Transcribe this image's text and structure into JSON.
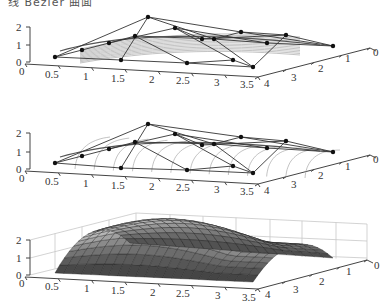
{
  "caption_fragment": "线 Bézier 曲面",
  "colors": {
    "axis": "#444444",
    "net": "#333333",
    "point": "#111111",
    "curve": "#9a9a9a",
    "grid": "#c8c8c8",
    "surface_dark": "#3a3a3a",
    "surface_light": "#c9c9c9",
    "surface_edge": "#1a1a1a"
  },
  "chart_data": [
    {
      "type": "surface-wireframe",
      "title": "",
      "description": "Bézier control net with isoparametric curves (u-direction)",
      "xlabel": "",
      "ylabel": "",
      "zlabel": "",
      "x_ticks": [
        "0",
        "0.5",
        "1",
        "1.5",
        "2",
        "2.5",
        "3",
        "3.5"
      ],
      "y_ticks": [
        "0",
        "1",
        "2",
        "3",
        "4"
      ],
      "z_ticks": [
        "0",
        "1",
        "2"
      ],
      "xlim": [
        0,
        3.5
      ],
      "ylim": [
        0,
        4
      ],
      "zlim": [
        0,
        2
      ],
      "grid": false,
      "control_points": [
        [
          0.5,
          4,
          0.5
        ],
        [
          1,
          3,
          1
        ],
        [
          1.5,
          2,
          1
        ],
        [
          2,
          1,
          2
        ],
        [
          2.5,
          0,
          1
        ],
        [
          1.5,
          4,
          0
        ],
        [
          2.5,
          3,
          1
        ],
        [
          3,
          2,
          1
        ],
        [
          3.5,
          1,
          1
        ],
        [
          3.5,
          0,
          0.5
        ],
        [
          2.5,
          4,
          0
        ],
        [
          3.5,
          4,
          0
        ]
      ]
    },
    {
      "type": "surface-wireframe",
      "title": "",
      "description": "Bézier control net with isoparametric curves (v-direction)",
      "xlabel": "",
      "ylabel": "",
      "zlabel": "",
      "x_ticks": [
        "0",
        "0.5",
        "1",
        "1.5",
        "2",
        "2.5",
        "3",
        "3.5"
      ],
      "y_ticks": [
        "0",
        "1",
        "2",
        "3",
        "4"
      ],
      "z_ticks": [
        "0",
        "1",
        "2"
      ],
      "xlim": [
        0,
        3.5
      ],
      "ylim": [
        0,
        4
      ],
      "zlim": [
        0,
        2
      ],
      "grid": false
    },
    {
      "type": "surface",
      "title": "",
      "description": "Shaded Bézier surface patch",
      "xlabel": "",
      "ylabel": "",
      "zlabel": "",
      "x_ticks": [
        "0",
        "0.5",
        "1",
        "1.5",
        "2",
        "2.5",
        "3",
        "3.5"
      ],
      "y_ticks": [
        "0",
        "1",
        "2",
        "3",
        "4"
      ],
      "z_ticks": [
        "0",
        "1",
        "2"
      ],
      "xlim": [
        0,
        3.5
      ],
      "ylim": [
        0,
        4
      ],
      "zlim": [
        0,
        2
      ],
      "grid": true
    }
  ],
  "plots": [
    {
      "id": "top",
      "x_axis": {
        "from": [
          25,
          64
        ],
        "to": [
          258,
          77
        ]
      },
      "y_axis": {
        "from": [
          258,
          77
        ],
        "to": [
          370,
          48
        ]
      },
      "z_axis": {
        "x": 30,
        "from": 62,
        "to": 27
      },
      "z_labels": [
        {
          "t": "0",
          "x": 16,
          "y": 66
        },
        {
          "t": "1",
          "x": 16,
          "y": 49
        },
        {
          "t": "2",
          "x": 16,
          "y": 31
        }
      ],
      "x_labels": [
        {
          "t": "0",
          "x": 19,
          "y": 75
        },
        {
          "t": "0.5",
          "x": 45,
          "y": 78
        },
        {
          "t": "1",
          "x": 83,
          "y": 80
        },
        {
          "t": "1.5",
          "x": 111,
          "y": 82
        },
        {
          "t": "2",
          "x": 149,
          "y": 83
        },
        {
          "t": "2.5",
          "x": 176,
          "y": 84
        },
        {
          "t": "3",
          "x": 214,
          "y": 86
        },
        {
          "t": "3.5",
          "x": 240,
          "y": 88
        }
      ],
      "y_labels": [
        {
          "t": "0",
          "x": 373,
          "y": 56
        },
        {
          "t": "1",
          "x": 345,
          "y": 62
        },
        {
          "t": "2",
          "x": 318,
          "y": 72
        },
        {
          "t": "3",
          "x": 291,
          "y": 81
        },
        {
          "t": "4",
          "x": 264,
          "y": 87
        }
      ],
      "points": [
        [
          55,
          57
        ],
        [
          82,
          50
        ],
        [
          109,
          43
        ],
        [
          135,
          36
        ],
        [
          148,
          17
        ],
        [
          175,
          28
        ],
        [
          202,
          39
        ],
        [
          214,
          39
        ],
        [
          241,
          32
        ],
        [
          267,
          43
        ],
        [
          286,
          35
        ],
        [
          333,
          46
        ],
        [
          121,
          60
        ],
        [
          187,
          63
        ],
        [
          233,
          60
        ],
        [
          253,
          67
        ]
      ],
      "net": [
        [
          [
            55,
            57
          ],
          [
            148,
            17
          ],
          [
            241,
            32
          ],
          [
            333,
            46
          ]
        ],
        [
          [
            55,
            57
          ],
          [
            82,
            50
          ],
          [
            109,
            43
          ],
          [
            135,
            36
          ],
          [
            214,
            39
          ],
          [
            267,
            43
          ]
        ],
        [
          [
            55,
            57
          ],
          [
            121,
            60
          ],
          [
            187,
            63
          ],
          [
            253,
            67
          ]
        ],
        [
          [
            148,
            17
          ],
          [
            214,
            39
          ],
          [
            253,
            67
          ]
        ],
        [
          [
            148,
            17
          ],
          [
            121,
            60
          ]
        ],
        [
          [
            175,
            28
          ],
          [
            233,
            60
          ],
          [
            187,
            63
          ]
        ],
        [
          [
            109,
            43
          ],
          [
            175,
            28
          ],
          [
            202,
            39
          ]
        ],
        [
          [
            135,
            36
          ],
          [
            187,
            63
          ]
        ],
        [
          [
            202,
            39
          ],
          [
            286,
            35
          ],
          [
            333,
            46
          ]
        ],
        [
          [
            241,
            32
          ],
          [
            286,
            35
          ]
        ],
        [
          [
            267,
            43
          ],
          [
            333,
            46
          ]
        ],
        [
          [
            233,
            60
          ],
          [
            253,
            67
          ],
          [
            286,
            35
          ]
        ],
        [
          [
            175,
            28
          ],
          [
            267,
            43
          ]
        ],
        [
          [
            214,
            39
          ],
          [
            241,
            32
          ]
        ]
      ],
      "mode": "u"
    },
    {
      "id": "middle",
      "x_axis": {
        "from": [
          25,
          171
        ],
        "to": [
          258,
          184
        ]
      },
      "y_axis": {
        "from": [
          258,
          184
        ],
        "to": [
          370,
          155
        ]
      },
      "z_axis": {
        "x": 30,
        "from": 169,
        "to": 133
      },
      "z_labels": [
        {
          "t": "0",
          "x": 16,
          "y": 173
        },
        {
          "t": "1",
          "x": 16,
          "y": 156
        },
        {
          "t": "2",
          "x": 16,
          "y": 137
        }
      ],
      "x_labels": [
        {
          "t": "0",
          "x": 19,
          "y": 182
        },
        {
          "t": "0.5",
          "x": 45,
          "y": 185
        },
        {
          "t": "1",
          "x": 83,
          "y": 187
        },
        {
          "t": "1.5",
          "x": 111,
          "y": 189
        },
        {
          "t": "2",
          "x": 149,
          "y": 190
        },
        {
          "t": "2.5",
          "x": 176,
          "y": 191
        },
        {
          "t": "3",
          "x": 214,
          "y": 193
        },
        {
          "t": "3.5",
          "x": 240,
          "y": 195
        }
      ],
      "y_labels": [
        {
          "t": "0",
          "x": 373,
          "y": 163
        },
        {
          "t": "1",
          "x": 345,
          "y": 170
        },
        {
          "t": "2",
          "x": 318,
          "y": 179
        },
        {
          "t": "3",
          "x": 291,
          "y": 188
        },
        {
          "t": "4",
          "x": 264,
          "y": 194
        }
      ],
      "points": [
        [
          55,
          163
        ],
        [
          82,
          156
        ],
        [
          109,
          149
        ],
        [
          135,
          142
        ],
        [
          148,
          124
        ],
        [
          175,
          134
        ],
        [
          202,
          145
        ],
        [
          214,
          144
        ],
        [
          241,
          137
        ],
        [
          267,
          148
        ],
        [
          286,
          141
        ],
        [
          333,
          152
        ],
        [
          121,
          168
        ],
        [
          187,
          170
        ],
        [
          233,
          166
        ],
        [
          253,
          173
        ]
      ],
      "net": [
        [
          [
            55,
            163
          ],
          [
            148,
            124
          ],
          [
            241,
            137
          ],
          [
            333,
            152
          ]
        ],
        [
          [
            55,
            163
          ],
          [
            82,
            156
          ],
          [
            109,
            149
          ],
          [
            135,
            142
          ],
          [
            214,
            144
          ],
          [
            267,
            148
          ]
        ],
        [
          [
            55,
            163
          ],
          [
            121,
            168
          ],
          [
            187,
            170
          ],
          [
            253,
            173
          ]
        ],
        [
          [
            148,
            124
          ],
          [
            214,
            144
          ],
          [
            253,
            173
          ]
        ],
        [
          [
            148,
            124
          ],
          [
            121,
            168
          ]
        ],
        [
          [
            175,
            134
          ],
          [
            233,
            166
          ],
          [
            187,
            170
          ]
        ],
        [
          [
            109,
            149
          ],
          [
            175,
            134
          ],
          [
            202,
            145
          ]
        ],
        [
          [
            135,
            142
          ],
          [
            187,
            170
          ]
        ],
        [
          [
            202,
            145
          ],
          [
            286,
            141
          ],
          [
            333,
            152
          ]
        ],
        [
          [
            241,
            137
          ],
          [
            286,
            141
          ]
        ],
        [
          [
            267,
            148
          ],
          [
            333,
            152
          ]
        ],
        [
          [
            233,
            166
          ],
          [
            253,
            173
          ],
          [
            286,
            141
          ]
        ],
        [
          [
            175,
            134
          ],
          [
            267,
            148
          ]
        ],
        [
          [
            214,
            144
          ],
          [
            241,
            137
          ]
        ]
      ],
      "mode": "v"
    },
    {
      "id": "bottom",
      "x_axis": {
        "from": [
          25,
          277
        ],
        "to": [
          258,
          289
        ]
      },
      "y_axis": {
        "from": [
          258,
          289
        ],
        "to": [
          367,
          260
        ]
      },
      "z_axis": {
        "x": 30,
        "from": 275,
        "to": 240
      },
      "z_labels": [
        {
          "t": "0",
          "x": 16,
          "y": 279
        },
        {
          "t": "1",
          "x": 16,
          "y": 262
        },
        {
          "t": "2",
          "x": 16,
          "y": 244
        }
      ],
      "x_labels": [
        {
          "t": "0",
          "x": 19,
          "y": 287
        },
        {
          "t": "0.5",
          "x": 45,
          "y": 290
        },
        {
          "t": "1",
          "x": 84,
          "y": 292
        },
        {
          "t": "1.5",
          "x": 111,
          "y": 294
        },
        {
          "t": "2",
          "x": 150,
          "y": 296
        },
        {
          "t": "2.5",
          "x": 176,
          "y": 297
        },
        {
          "t": "3",
          "x": 215,
          "y": 299
        },
        {
          "t": "3.5",
          "x": 242,
          "y": 301
        }
      ],
      "y_labels": [
        {
          "t": "0",
          "x": 374,
          "y": 269
        },
        {
          "t": "1",
          "x": 346,
          "y": 275
        },
        {
          "t": "2",
          "x": 319,
          "y": 285
        },
        {
          "t": "3",
          "x": 293,
          "y": 293
        },
        {
          "t": "4",
          "x": 265,
          "y": 298
        }
      ]
    }
  ]
}
